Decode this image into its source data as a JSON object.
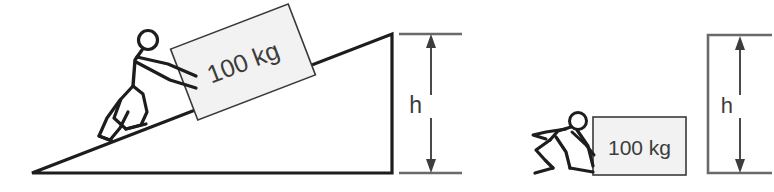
{
  "figure": {
    "background_color": "#ffffff",
    "ink_color": "#1d1d1d",
    "box_fill_color": "#f2f2f2",
    "box_stroke_color": "#3a3a3a",
    "label_color": "#3c3c3c"
  },
  "left_scene": {
    "name": "incline-scene",
    "description": "Stick figure pushing a 100 kg crate up an inclined plane",
    "load_label": "100 kg",
    "height_label": "h",
    "ramp": {
      "apex_x": 392,
      "apex_y": 34,
      "left_vertex_x": 32,
      "left_vertex_y": 173,
      "base_right_x": 392,
      "base_right_y": 173
    },
    "dimension": {
      "top_y": 34,
      "bottom_y": 173,
      "arrow_x": 431,
      "tick_left_x": 399,
      "tick_right_x": 462
    }
  },
  "right_scene": {
    "name": "flat-push-scene",
    "description": "Stick figure pushing a 100 kg crate along level ground",
    "load_label": "100 kg",
    "height_label": "h",
    "crate": {
      "left_x": 593,
      "top_y": 117,
      "right_x": 686,
      "bottom_y": 175
    },
    "bracket": {
      "left_x": 708,
      "top_y": 35,
      "bottom_y": 173,
      "right_x": 772,
      "arrow_x": 740
    }
  }
}
